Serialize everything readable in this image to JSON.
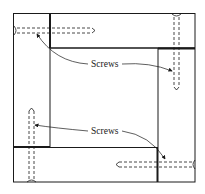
{
  "diagram": {
    "colors": {
      "line": "#1a1a1a",
      "background": "#ffffff"
    },
    "labels": [
      {
        "id": "screws-top",
        "text": "Screws"
      },
      {
        "id": "screws-bottom",
        "text": "Screws"
      }
    ],
    "components": [
      "outer-frame",
      "inner-opening",
      "top-rail",
      "right-stile",
      "bottom-rail",
      "left-stile",
      "screw-top-left",
      "screw-top-right",
      "screw-bottom-left",
      "screw-bottom-right"
    ]
  }
}
